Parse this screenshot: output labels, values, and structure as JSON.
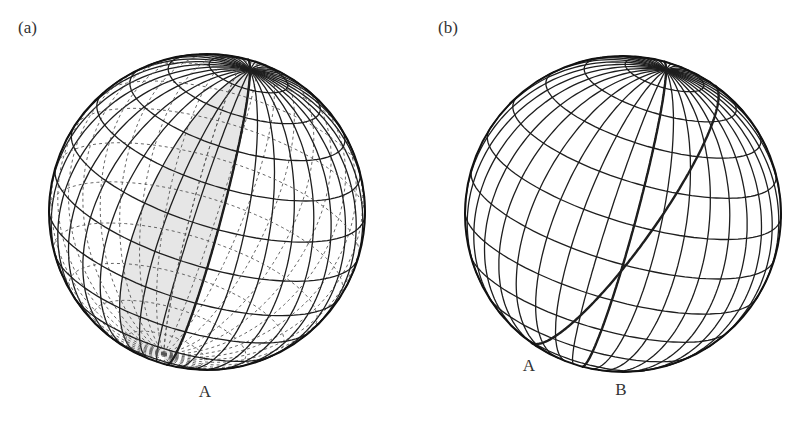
{
  "figure": {
    "panels": [
      {
        "id": "a",
        "label": "(a)",
        "label_pos": [
          18,
          18
        ],
        "center": [
          207,
          212
        ],
        "radius": 158,
        "pole_screen": [
          250,
          70
        ],
        "meridian_step_deg": 10,
        "parallel_step_deg": 15,
        "show_back": true,
        "shaded_lune": {
          "from_meridian_deg": 0,
          "to_meridian_deg": 30,
          "fill": "#e6e6e6"
        },
        "bold_meridians_deg": [
          0
        ],
        "bold_great_circles": [],
        "points": [
          {
            "name": "A",
            "label": "A",
            "label_pos": [
              205,
              382
            ]
          }
        ]
      },
      {
        "id": "b",
        "label": "(b)",
        "label_pos": [
          438,
          18
        ],
        "center": [
          623,
          214
        ],
        "radius": 158,
        "pole_screen": [
          666,
          70
        ],
        "meridian_step_deg": 10,
        "parallel_step_deg": 15,
        "show_back": false,
        "shaded_lune": null,
        "bold_meridians_deg": [
          0
        ],
        "bold_great_circles": [
          {
            "through_screen": [
              [
                535,
                344
              ],
              [
                715,
                85
              ]
            ]
          }
        ],
        "points": [
          {
            "name": "A",
            "label": "A",
            "label_pos": [
              529,
              356
            ]
          },
          {
            "name": "B",
            "label": "B",
            "label_pos": [
              621,
              380
            ]
          }
        ]
      }
    ],
    "colors": {
      "line": "#1e1e1e",
      "back_line": "#555555",
      "outline": "#111111"
    }
  }
}
